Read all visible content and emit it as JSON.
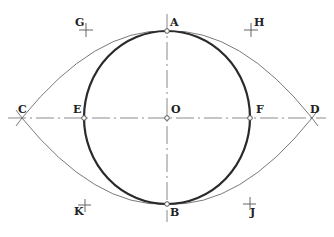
{
  "diagram": {
    "type": "geometric-construction",
    "colors": {
      "main_curve": "#2a2a2a",
      "thin_arc": "#6a6a6a",
      "center_line": "#8a8a8a",
      "marker": "#555555",
      "label": "#222222"
    },
    "points": {
      "A": {
        "label": "A",
        "x": 167,
        "y": 31
      },
      "B": {
        "label": "B",
        "x": 167,
        "y": 204
      },
      "C": {
        "label": "C",
        "x": 22,
        "y": 118
      },
      "D": {
        "label": "D",
        "x": 312,
        "y": 118
      },
      "E": {
        "label": "E",
        "x": 84,
        "y": 118
      },
      "F": {
        "label": "F",
        "x": 250,
        "y": 118
      },
      "O": {
        "label": "O",
        "x": 167,
        "y": 118
      },
      "G": {
        "label": "G",
        "x": 86,
        "y": 30
      },
      "H": {
        "label": "H",
        "x": 251,
        "y": 30
      },
      "K": {
        "label": "K",
        "x": 84,
        "y": 206
      },
      "J": {
        "label": "J",
        "x": 250,
        "y": 204
      }
    },
    "labels": {
      "A": "A",
      "B": "B",
      "C": "C",
      "D": "D",
      "E": "E",
      "F": "F",
      "O": "O",
      "G": "G",
      "H": "H",
      "K": "K",
      "J": "J"
    }
  }
}
